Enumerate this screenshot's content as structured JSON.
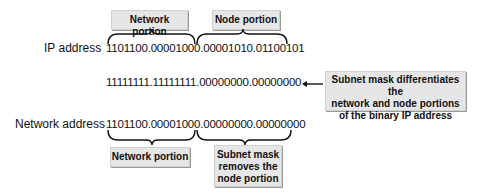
{
  "top": {
    "network_label": "Network portion",
    "node_label": "Node portion"
  },
  "rows": {
    "ip": {
      "label": "IP address",
      "bits": "1101100.00001000.00001010.01100101"
    },
    "mask": {
      "label": "",
      "bits": "11111111.11111111.00000000.00000000"
    },
    "network": {
      "label": "Network address",
      "bits": "1101100.00001000.00000000.00000000"
    }
  },
  "callouts": {
    "mask_note_line1": "Subnet mask differentiates the",
    "mask_note_line2": "network and node portions",
    "mask_note_line3": "of the binary IP address",
    "bottom_network": "Network portion",
    "bottom_mask_line1": "Subnet mask",
    "bottom_mask_line2": "removes the",
    "bottom_mask_line3": "node portion"
  },
  "colors": {
    "box_bg": "#e6e6e6",
    "text": "#111111"
  }
}
